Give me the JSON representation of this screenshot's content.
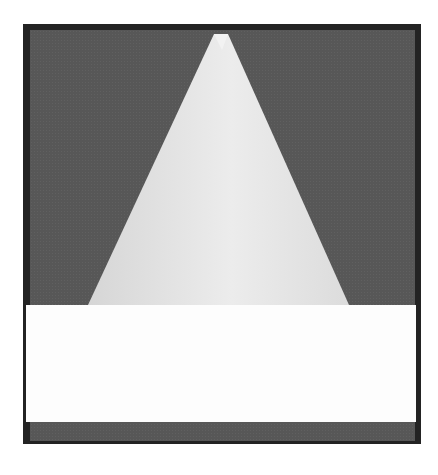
{
  "image": {
    "description": "Grayscale micrograph of a pyramidal / triangular tip on dark background with a white horizontal band near the bottom",
    "colors": {
      "frame": "#232323",
      "background": "#575757",
      "tip_light": "#e2e2e2",
      "tip_highlight": "#f0f0f0",
      "band": "#fdfdfd"
    },
    "tip_geometry": {
      "apex": [
        221,
        32
      ],
      "base_left": [
        88,
        305
      ],
      "base_right": [
        349,
        305
      ]
    }
  }
}
